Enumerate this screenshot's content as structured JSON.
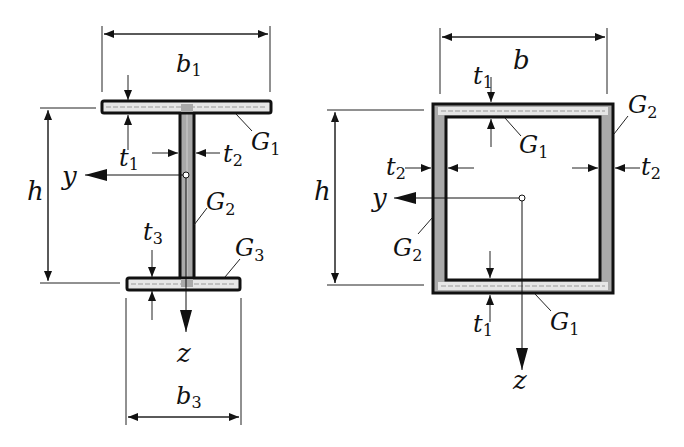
{
  "figure": {
    "colors": {
      "outline": "#111111",
      "web_fill": "#a9a9a9",
      "flange_fill": "#e6e6e6",
      "dim_line": "#222222",
      "background": "#ffffff"
    }
  },
  "i_section": {
    "labels": {
      "b1": {
        "base": "b",
        "sub": "1"
      },
      "b3": {
        "base": "b",
        "sub": "3"
      },
      "h": {
        "base": "h"
      },
      "t1": {
        "base": "t",
        "sub": "1"
      },
      "t2": {
        "base": "t",
        "sub": "2"
      },
      "t3": {
        "base": "t",
        "sub": "3"
      },
      "G1": {
        "base": "G",
        "sub": "1"
      },
      "G2": {
        "base": "G",
        "sub": "2"
      },
      "G3": {
        "base": "G",
        "sub": "3"
      },
      "y": {
        "base": "y"
      },
      "z": {
        "base": "z"
      }
    }
  },
  "box_section": {
    "labels": {
      "b": {
        "base": "b"
      },
      "h": {
        "base": "h"
      },
      "t1_top": {
        "base": "t",
        "sub": "1"
      },
      "t1_bottom": {
        "base": "t",
        "sub": "1"
      },
      "t2_left": {
        "base": "t",
        "sub": "2"
      },
      "t2_right": {
        "base": "t",
        "sub": "2"
      },
      "G1_top": {
        "base": "G",
        "sub": "1"
      },
      "G1_bottom": {
        "base": "G",
        "sub": "1"
      },
      "G2_right": {
        "base": "G",
        "sub": "2"
      },
      "G2_left": {
        "base": "G",
        "sub": "2"
      },
      "y": {
        "base": "y"
      },
      "z": {
        "base": "z"
      }
    }
  }
}
